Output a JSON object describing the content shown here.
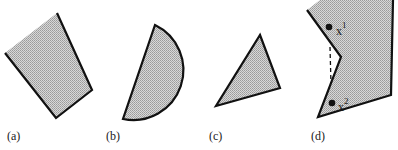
{
  "figure": {
    "panels": [
      {
        "id": "a",
        "label": "(a)",
        "shape": "quadrilateral",
        "convex": true
      },
      {
        "id": "b",
        "label": "(b)",
        "shape": "half-disc",
        "convex": true
      },
      {
        "id": "c",
        "label": "(c)",
        "shape": "triangle",
        "convex": true
      },
      {
        "id": "d",
        "label": "(d)",
        "shape": "nonconvex polygon",
        "convex": false,
        "points": [
          {
            "name": "x1",
            "base": "x",
            "sup": "1"
          },
          {
            "name": "x2",
            "base": "x",
            "sup": "2"
          }
        ]
      }
    ],
    "colors": {
      "fill": "#c8c8c8",
      "stroke": "#111111",
      "background": "#ffffff"
    }
  }
}
